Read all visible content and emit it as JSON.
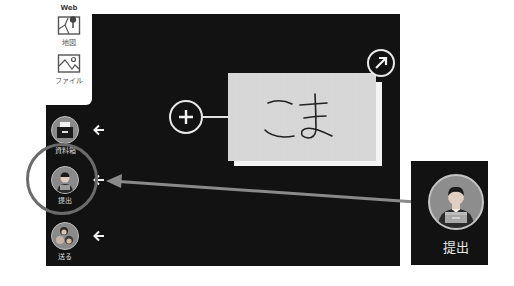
{
  "top_panel": {
    "section_label": "Web",
    "tools": [
      {
        "label": "地図",
        "icon": "map-icon"
      },
      {
        "label": "ファイル",
        "icon": "image-file-icon"
      }
    ]
  },
  "sidebar": {
    "items": [
      {
        "label": "資料箱",
        "icon": "document-box-icon"
      },
      {
        "label": "提出",
        "icon": "submit-person-icon",
        "highlighted": true
      },
      {
        "label": "送る",
        "icon": "send-people-icon"
      }
    ]
  },
  "canvas": {
    "card_text": "こま",
    "add_button": "+",
    "expand_button": "↗"
  },
  "callout": {
    "label": "提出"
  },
  "colors": {
    "canvas": "#121212",
    "card": "#d6d6d6",
    "highlight_ring": "#6b6b6b",
    "pointer_arrow": "#8a8a8a"
  }
}
